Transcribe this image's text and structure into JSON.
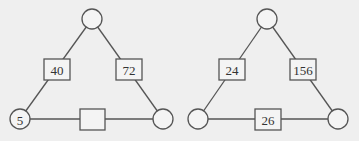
{
  "diagrams": [
    {
      "name": "left-triangle",
      "circles": {
        "top": {
          "label": "",
          "cx": 92,
          "cy": 19
        },
        "bottom_left": {
          "label": "5",
          "cx": 20,
          "cy": 119
        },
        "bottom_right": {
          "label": "",
          "cx": 163,
          "cy": 119
        }
      },
      "boxes": {
        "left": {
          "label": "40",
          "x": 44,
          "y": 59
        },
        "right": {
          "label": "72",
          "x": 116,
          "y": 59
        },
        "bottom": {
          "label": "",
          "x": 80,
          "y": 109
        }
      }
    },
    {
      "name": "right-triangle",
      "circles": {
        "top": {
          "label": "",
          "cx": 267,
          "cy": 19
        },
        "bottom_left": {
          "label": "",
          "cx": 198,
          "cy": 119
        },
        "bottom_right": {
          "label": "",
          "cx": 338,
          "cy": 119
        }
      },
      "boxes": {
        "left": {
          "label": "24",
          "x": 219,
          "y": 59
        },
        "right": {
          "label": "156",
          "x": 290,
          "y": 59
        },
        "bottom": {
          "label": "26",
          "x": 255,
          "y": 109
        }
      }
    }
  ],
  "style": {
    "background": "#efefef",
    "stroke": "#555555"
  }
}
